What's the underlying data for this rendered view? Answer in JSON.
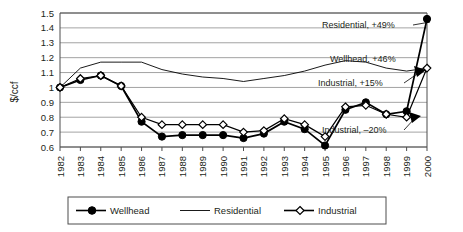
{
  "chart_data": {
    "type": "line",
    "title": "",
    "xlabel": "",
    "ylabel": "$/ccf",
    "ylim": [
      0.6,
      1.5
    ],
    "ytick_step": 0.1,
    "yticks": [
      "0.6",
      "0.7",
      "0.8",
      "0.9",
      "1",
      "1.1",
      "1.2",
      "1.3",
      "1.4",
      "1.5"
    ],
    "grid": true,
    "legend_position": "bottom",
    "categories": [
      "1982",
      "1983",
      "1984",
      "1985",
      "1986",
      "1987",
      "1988",
      "1989",
      "1990",
      "1991",
      "1992",
      "1993",
      "1994",
      "1995",
      "1996",
      "1997",
      "1998",
      "1999",
      "2000"
    ],
    "series": [
      {
        "name": "Wellhead",
        "marker": "filled-circle",
        "values": [
          1.0,
          1.05,
          1.08,
          1.01,
          0.77,
          0.67,
          0.68,
          0.68,
          0.68,
          0.66,
          0.69,
          0.77,
          0.72,
          0.61,
          0.85,
          0.9,
          0.82,
          0.84,
          1.46
        ]
      },
      {
        "name": "Residential",
        "marker": "none",
        "values": [
          1.0,
          1.13,
          1.17,
          1.17,
          1.17,
          1.12,
          1.09,
          1.07,
          1.06,
          1.04,
          1.06,
          1.08,
          1.11,
          1.15,
          1.18,
          1.17,
          1.13,
          1.11,
          1.13
        ]
      },
      {
        "name": "Industrial",
        "marker": "open-diamond",
        "values": [
          1.0,
          1.06,
          1.08,
          1.01,
          0.8,
          0.75,
          0.75,
          0.75,
          0.75,
          0.7,
          0.71,
          0.79,
          0.75,
          0.67,
          0.87,
          0.88,
          0.82,
          0.8,
          1.13
        ]
      }
    ],
    "annotations": [
      {
        "text": "Residential, +49%"
      },
      {
        "text": "Wellhead, +46%"
      },
      {
        "text": "Industrial, +15%"
      },
      {
        "text": "Industrial, –20%"
      }
    ]
  },
  "legend": {
    "items": [
      {
        "label": "Wellhead",
        "marker": "filled-circle"
      },
      {
        "label": "Residential",
        "marker": "none"
      },
      {
        "label": "Industrial",
        "marker": "open-diamond"
      }
    ]
  }
}
